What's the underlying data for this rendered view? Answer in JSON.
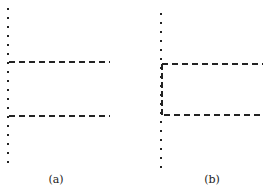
{
  "figure": {
    "panels": [
      {
        "id": "a",
        "label": "(a)",
        "dotted_line": {
          "x": 8,
          "y_start": 9,
          "y_end": 170,
          "spacing": 9
        },
        "dashed_lines": [
          {
            "x1": 9,
            "x2": 110,
            "y": 62
          },
          {
            "x1": 9,
            "x2": 110,
            "y": 116
          }
        ],
        "vertical_dashed": null
      },
      {
        "id": "b",
        "label": "(b)",
        "dotted_line": {
          "x": 161,
          "y_start": 14,
          "y_end": 170,
          "spacing": 9
        },
        "dashed_lines": [
          {
            "x1": 162,
            "x2": 263,
            "y": 64
          },
          {
            "x1": 164,
            "x2": 263,
            "y": 115
          }
        ],
        "vertical_dashed": {
          "x": 162,
          "y1": 64,
          "y2": 115
        }
      }
    ],
    "colors": {
      "line": "#222222",
      "background": "#ffffff"
    }
  }
}
